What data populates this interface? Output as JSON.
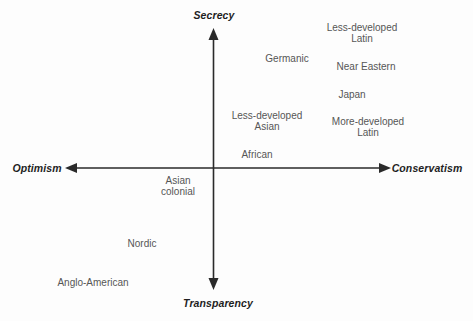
{
  "diagram": {
    "axes": {
      "top": "Secrecy",
      "bottom": "Transparency",
      "left": "Optimism",
      "right": "Conservatism"
    },
    "items": [
      {
        "label": "Less-developed\nLatin",
        "x": 362,
        "y": 22
      },
      {
        "label": "Germanic",
        "x": 287,
        "y": 53
      },
      {
        "label": "Near Eastern",
        "x": 366,
        "y": 61
      },
      {
        "label": "Japan",
        "x": 352,
        "y": 89
      },
      {
        "label": "Less-developed\nAsian",
        "x": 267,
        "y": 110
      },
      {
        "label": "More-developed\nLatin",
        "x": 368,
        "y": 116
      },
      {
        "label": "African",
        "x": 257,
        "y": 149
      },
      {
        "label": "Asian\ncolonial",
        "x": 178,
        "y": 175
      },
      {
        "label": "Nordic",
        "x": 142,
        "y": 238
      },
      {
        "label": "Anglo-American",
        "x": 93,
        "y": 277
      }
    ],
    "colors": {
      "axis_line": "#2a2a2a",
      "axis_label_text": "#1f1f1f",
      "item_text": "#565656",
      "background": "#fdfdfd"
    }
  }
}
